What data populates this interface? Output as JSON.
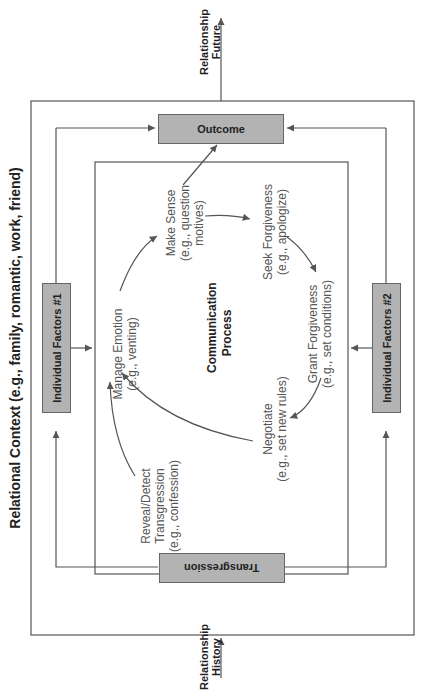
{
  "title": "Relational Context (e.g., family, romantic, work, friend)",
  "external": {
    "future": "Relationship\nFuture",
    "history": "Relationship\nHistory"
  },
  "boxes": {
    "outcome": "Outcome",
    "transgression": "Transgression",
    "factors1": "Individual Factors #1",
    "factors2": "Individual Factors #2"
  },
  "center": "Communication\nProcess",
  "steps": {
    "reveal": "Reveal/Detect\nTransgression\n(e.g., confession)",
    "manage": "Manage Emotion\n(e.g., venting)",
    "sense": "Make Sense\n(e.g., question\nmotives)",
    "seek": "Seek Forgiveness\n(e.g., apologize)",
    "grant": "Grant Forgiveness\n(e.g., set conditions)",
    "negotiate": "Negotiate\n(e.g., set new rules)"
  },
  "colors": {
    "box_fill": "#b3b3b3",
    "line": "#555555"
  }
}
